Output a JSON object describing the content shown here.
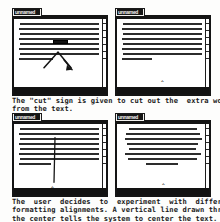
{
  "document": {
    "kind": "scanned-figure",
    "ink_color": "#1a1a1a",
    "paper_color": "#fdfdfc"
  },
  "figures": [
    {
      "id": "figure-cut-gesture",
      "windows": [
        {
          "title": "unnamed",
          "state": "before-cut",
          "alignment": "justified",
          "has_highlighted_word": true,
          "gesture": "cut-caret-mark",
          "cursor_glyph": ""
        },
        {
          "title": "unnamed",
          "state": "after-cut",
          "alignment": "justified",
          "has_highlighted_word": false,
          "gesture": "none",
          "cursor_glyph": "‸"
        }
      ],
      "caption_lines": [
        "The \"cut\" sign is given to cut out the  extra word",
        "from the text."
      ]
    },
    {
      "id": "figure-center-gesture",
      "windows": [
        {
          "title": "unnamed",
          "state": "before-center",
          "alignment": "justified",
          "has_highlighted_word": false,
          "gesture": "vertical-center-line",
          "cursor_glyph": "‸"
        },
        {
          "title": "unnamed",
          "state": "after-center",
          "alignment": "center",
          "has_highlighted_word": false,
          "gesture": "none",
          "cursor_glyph": "‸"
        }
      ],
      "caption_lines": [
        "The  user  decides  to  experiment  with  different",
        "formatting alignments. A vertical line drawn through",
        "the center tells the system to center the text."
      ]
    }
  ],
  "body_text_lines": {
    "justified": [
      [
        3,
        92
      ],
      [
        2,
        94
      ],
      [
        3,
        93
      ],
      [
        2,
        95
      ],
      [
        3,
        91
      ],
      [
        2,
        94
      ],
      [
        3,
        90
      ],
      [
        2,
        44
      ]
    ],
    "centered": [
      [
        12,
        74
      ],
      [
        8,
        82
      ],
      [
        6,
        86
      ],
      [
        9,
        78
      ],
      [
        11,
        74
      ],
      [
        7,
        84
      ],
      [
        10,
        76
      ],
      [
        30,
        36
      ]
    ]
  },
  "scroll_ticks": [
    4,
    11,
    18,
    25,
    32,
    39
  ]
}
